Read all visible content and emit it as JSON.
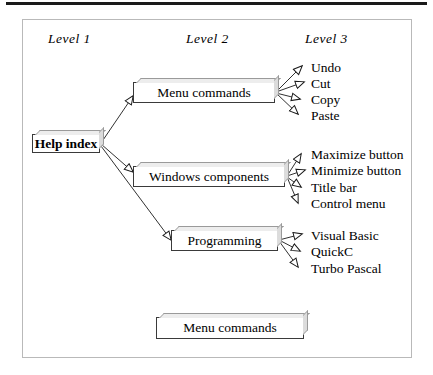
{
  "figure": {
    "type": "hierarchy-tree-diagram",
    "headers": [
      {
        "label": "Level 1"
      },
      {
        "label": "Level 2"
      },
      {
        "label": "Level 3"
      }
    ],
    "root": {
      "label": "Help index"
    },
    "branches": [
      {
        "label": "Menu commands",
        "leaves": [
          {
            "label": "Undo"
          },
          {
            "label": "Cut"
          },
          {
            "label": "Copy"
          },
          {
            "label": "Paste"
          }
        ]
      },
      {
        "label": "Windows components",
        "leaves": [
          {
            "label": "Maximize button"
          },
          {
            "label": "Minimize button"
          },
          {
            "label": "Title bar"
          },
          {
            "label": "Control menu"
          }
        ]
      },
      {
        "label": "Programming",
        "leaves": [
          {
            "label": "Visual Basic"
          },
          {
            "label": "QuickC"
          },
          {
            "label": "Turbo Pascal"
          }
        ]
      }
    ],
    "standalone_box": {
      "label": "Menu commands"
    },
    "colors": {
      "line": "#1a1a1a",
      "box_border": "#3a3a3a",
      "bevel_top": "#ededed",
      "bevel_side": "#dcdcdc",
      "frame": "#b9b9b9",
      "rule": "#1a1a1a",
      "background": "#ffffff"
    }
  }
}
